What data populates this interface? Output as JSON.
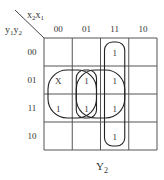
{
  "kmap": {
    "title": "Y2",
    "title_main": "Y",
    "title_sub": "2",
    "col_var": {
      "a": "x",
      "a_sub": "2",
      "b": "x",
      "b_sub": "1"
    },
    "row_var": {
      "a": "y",
      "a_sub": "1",
      "b": "y",
      "b_sub": "2"
    },
    "col_labels": [
      "00",
      "01",
      "11",
      "10"
    ],
    "row_labels": [
      "00",
      "01",
      "11",
      "10"
    ],
    "cells": [
      [
        "",
        "",
        "1",
        ""
      ],
      [
        "X",
        "1",
        "1",
        ""
      ],
      [
        "1",
        "1",
        "1",
        ""
      ],
      [
        "",
        "",
        "1",
        ""
      ]
    ],
    "groups": [
      {
        "name": "group-column-11",
        "rows": [
          0,
          3
        ],
        "cols": [
          2,
          2
        ]
      },
      {
        "name": "group-column-01-rows-01-11",
        "rows": [
          1,
          2
        ],
        "cols": [
          1,
          1
        ]
      },
      {
        "name": "group-rows-01-11-cols-00-01",
        "rows": [
          1,
          2
        ],
        "cols": [
          0,
          1
        ]
      },
      {
        "name": "group-rows-01-11-cols-01-11",
        "rows": [
          1,
          2
        ],
        "cols": [
          1,
          2
        ]
      }
    ]
  }
}
